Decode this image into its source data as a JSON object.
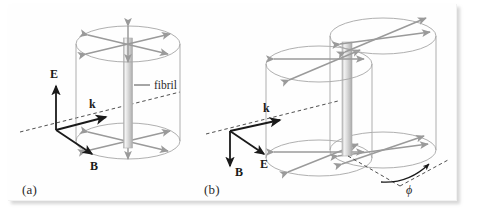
{
  "figure": {
    "background_color": "#ffffff",
    "panel_color": "#fefefe",
    "arrow_color": "#9a9a9a",
    "outline_color": "#a6a6a6",
    "vector_color": "#1a1a1a",
    "dashed_color": "#3a3a3a",
    "fibril_color": "#c9c9c9"
  },
  "panels": [
    {
      "id": "a",
      "caption": "(a)",
      "fibril_label": "fibril",
      "vectors": [
        {
          "name": "E",
          "label": "E",
          "direction": "up"
        },
        {
          "name": "k",
          "label": "k",
          "direction": "right-down"
        },
        {
          "name": "B",
          "label": "B",
          "direction": "down-right"
        }
      ],
      "cylinder_count": 1,
      "radial_arrow_pairs_per_disc": 3,
      "disc_count": 2
    },
    {
      "id": "b",
      "caption": "(b)",
      "vectors": [
        {
          "name": "k",
          "label": "k",
          "direction": "right-down"
        },
        {
          "name": "B",
          "label": "B",
          "direction": "down"
        },
        {
          "name": "E",
          "label": "E",
          "direction": "down-right"
        }
      ],
      "angle": {
        "symbol": "ϕ",
        "name": "phi"
      },
      "cylinder_count": 2,
      "radial_arrow_pairs_per_disc": 3,
      "disc_count": 4
    }
  ]
}
